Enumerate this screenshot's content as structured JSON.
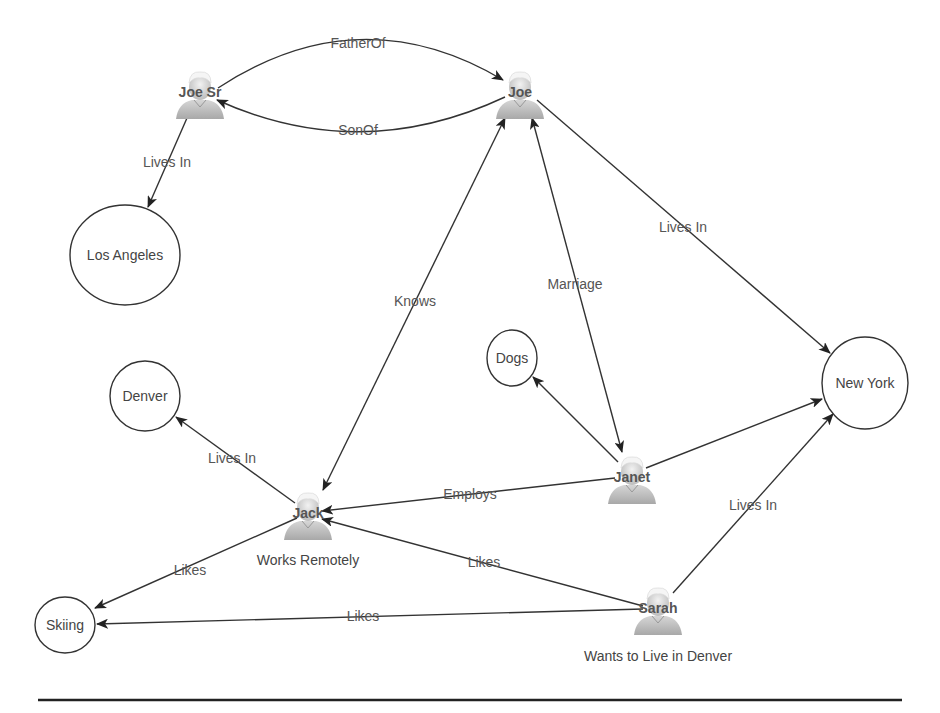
{
  "diagram": {
    "type": "knowledge-graph",
    "people": [
      {
        "id": "joe_sr",
        "label": "Joe Sr",
        "x": 200,
        "y": 95,
        "caption": ""
      },
      {
        "id": "joe",
        "label": "Joe",
        "x": 520,
        "y": 95,
        "caption": ""
      },
      {
        "id": "janet",
        "label": "Janet",
        "x": 632,
        "y": 480,
        "caption": ""
      },
      {
        "id": "jack",
        "label": "Jack",
        "x": 308,
        "y": 517,
        "caption": "Works Remotely"
      },
      {
        "id": "sarah",
        "label": "Sarah",
        "x": 658,
        "y": 610,
        "caption": "Wants to Live in Denver"
      }
    ],
    "entities": [
      {
        "id": "los_angeles",
        "label": "Los Angeles",
        "x": 125,
        "y": 255,
        "rx": 55,
        "ry": 50
      },
      {
        "id": "denver",
        "label": "Denver",
        "x": 145,
        "y": 396,
        "rx": 35,
        "ry": 35
      },
      {
        "id": "dogs",
        "label": "Dogs",
        "x": 512,
        "y": 358,
        "rx": 25,
        "ry": 28
      },
      {
        "id": "new_york",
        "label": "New York",
        "x": 865,
        "y": 383,
        "rx": 43,
        "ry": 46
      },
      {
        "id": "skiing",
        "label": "Skiing",
        "x": 65,
        "y": 625,
        "rx": 30,
        "ry": 28
      }
    ],
    "edges": [
      {
        "from": "joe_sr",
        "to": "joe",
        "label": "FatherOf"
      },
      {
        "from": "joe",
        "to": "joe_sr",
        "label": "SonOf"
      },
      {
        "from": "joe_sr",
        "to": "los_angeles",
        "label": "Lives In"
      },
      {
        "from": "joe",
        "to": "new_york",
        "label": "Lives In"
      },
      {
        "from": "joe",
        "to": "jack",
        "label": "Knows",
        "bidirectional": true
      },
      {
        "from": "joe",
        "to": "janet",
        "label": "Marriage",
        "bidirectional": true
      },
      {
        "from": "janet",
        "to": "dogs",
        "label": ""
      },
      {
        "from": "janet",
        "to": "new_york",
        "label": ""
      },
      {
        "from": "janet",
        "to": "jack",
        "label": "Employs"
      },
      {
        "from": "jack",
        "to": "denver",
        "label": "Lives In"
      },
      {
        "from": "jack",
        "to": "skiing",
        "label": "Likes"
      },
      {
        "from": "sarah",
        "to": "jack",
        "label": "Likes"
      },
      {
        "from": "sarah",
        "to": "skiing",
        "label": "Likes"
      },
      {
        "from": "sarah",
        "to": "new_york",
        "label": "Lives In"
      }
    ],
    "edge_labels": {
      "father_of": "FatherOf",
      "son_of": "SonOf",
      "joe_sr_lives_in": "Lives In",
      "joe_lives_in": "Lives In",
      "knows": "Knows",
      "marriage": "Marriage",
      "employs": "Employs",
      "jack_lives_in": "Lives In",
      "jack_likes": "Likes",
      "sarah_likes_jack": "Likes",
      "sarah_likes_skiing": "Likes",
      "sarah_lives_in": "Lives In"
    },
    "colors": {
      "stroke": "#333333",
      "text": "#444444",
      "person_fill": "#c8c8c8"
    }
  }
}
